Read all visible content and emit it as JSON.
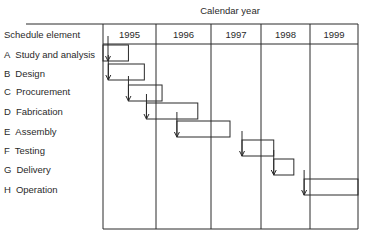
{
  "diagram": {
    "title": "Calendar year",
    "row_header": "Schedule element",
    "years": [
      "1995",
      "1996",
      "1997",
      "1998",
      "1999"
    ],
    "elements": [
      {
        "letter": "A",
        "name": "Study and analysis",
        "start": 0.0,
        "end": 0.48
      },
      {
        "letter": "B",
        "name": "Design",
        "start": 0.1,
        "end": 0.78
      },
      {
        "letter": "C",
        "name": "Procurement",
        "start": 0.48,
        "end": 1.11
      },
      {
        "letter": "D",
        "name": "Fabrication",
        "start": 0.82,
        "end": 1.76
      },
      {
        "letter": "E",
        "name": "Assembly",
        "start": 1.38,
        "end": 2.38
      },
      {
        "letter": "F",
        "name": "Testing",
        "start": 2.62,
        "end": 3.26
      },
      {
        "letter": "G",
        "name": "Delivery",
        "start": 3.26,
        "end": 3.67
      },
      {
        "letter": "H",
        "name": "Operation",
        "start": 3.88,
        "end": 5.0
      }
    ],
    "dependencies": [
      {
        "from": "A",
        "to": "B"
      },
      {
        "from": "B",
        "to": "C"
      },
      {
        "from": "C",
        "to": "D"
      },
      {
        "from": "D",
        "to": "E"
      },
      {
        "from": "E",
        "to": "F"
      },
      {
        "from": "F",
        "to": "G"
      },
      {
        "from": "G",
        "to": "H"
      }
    ]
  }
}
